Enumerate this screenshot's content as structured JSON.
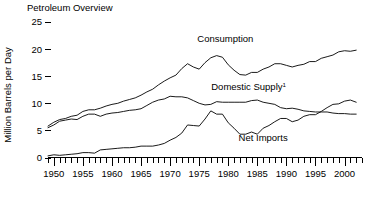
{
  "chart_data": {
    "type": "line",
    "title": "Petroleum Overview",
    "xlabel": "",
    "ylabel": "Million Barrels per Day",
    "xlim": [
      1949,
      2003
    ],
    "ylim": [
      0,
      25
    ],
    "yticks": [
      "0",
      "5",
      "10",
      "15",
      "20",
      "25"
    ],
    "ytick_values": [
      0,
      5,
      10,
      15,
      20,
      25
    ],
    "xticks": [
      "1950",
      "1955",
      "1960",
      "1965",
      "1970",
      "1975",
      "1980",
      "1985",
      "1990",
      "1995",
      "2000"
    ],
    "xtick_values": [
      1950,
      1955,
      1960,
      1965,
      1970,
      1975,
      1980,
      1985,
      1990,
      1995,
      2000
    ],
    "minor_tick_interval": 1,
    "grid": false,
    "legend": "inline-labels",
    "footnote_marker": "1",
    "x": [
      1949,
      1950,
      1951,
      1952,
      1953,
      1954,
      1955,
      1956,
      1957,
      1958,
      1959,
      1960,
      1961,
      1962,
      1963,
      1964,
      1965,
      1966,
      1967,
      1968,
      1969,
      1970,
      1971,
      1972,
      1973,
      1974,
      1975,
      1976,
      1977,
      1978,
      1979,
      1980,
      1981,
      1982,
      1983,
      1984,
      1985,
      1986,
      1987,
      1988,
      1989,
      1990,
      1991,
      1992,
      1993,
      1994,
      1995,
      1996,
      1997,
      1998,
      1999,
      2000,
      2001,
      2002
    ],
    "series": [
      {
        "name": "Consumption",
        "label": "Consumption",
        "label_x": 1979.5,
        "label_y": 21.3,
        "values": [
          5.8,
          6.5,
          7.0,
          7.2,
          7.6,
          7.8,
          8.5,
          8.8,
          8.8,
          9.1,
          9.5,
          9.8,
          10.0,
          10.4,
          10.7,
          11.0,
          11.5,
          12.1,
          12.6,
          13.4,
          14.1,
          14.7,
          15.2,
          16.4,
          17.3,
          16.7,
          16.3,
          17.5,
          18.4,
          18.8,
          18.5,
          17.1,
          16.1,
          15.3,
          15.2,
          15.7,
          15.7,
          16.3,
          16.7,
          17.3,
          17.3,
          17.0,
          16.7,
          17.0,
          17.2,
          17.7,
          17.7,
          18.3,
          18.6,
          18.9,
          19.5,
          19.7,
          19.6,
          19.8
        ]
      },
      {
        "name": "Domestic Supply",
        "label": "Domestic Supply",
        "label_x": 1983.5,
        "label_y": 12.4,
        "values": [
          5.5,
          6.0,
          6.7,
          6.9,
          7.1,
          7.0,
          7.6,
          8.0,
          8.0,
          7.6,
          8.0,
          8.2,
          8.3,
          8.5,
          8.7,
          8.8,
          9.0,
          9.6,
          10.2,
          10.6,
          10.8,
          11.3,
          11.2,
          11.2,
          11.0,
          10.5,
          10.0,
          9.7,
          9.8,
          10.3,
          10.2,
          10.2,
          10.2,
          10.2,
          10.2,
          10.5,
          10.6,
          10.2,
          10.0,
          9.8,
          9.2,
          9.0,
          9.1,
          8.9,
          8.6,
          8.5,
          8.4,
          8.4,
          8.4,
          8.2,
          8.1,
          8.1,
          8.0,
          8.0
        ]
      },
      {
        "name": "Net Imports",
        "label": "Net Imports",
        "label_x": 1986.0,
        "label_y": 3.1,
        "values": [
          0.3,
          0.5,
          0.4,
          0.5,
          0.6,
          0.7,
          0.9,
          0.9,
          0.8,
          1.4,
          1.5,
          1.6,
          1.7,
          1.8,
          1.8,
          1.9,
          2.1,
          2.1,
          2.1,
          2.3,
          2.6,
          3.2,
          3.7,
          4.5,
          6.0,
          5.9,
          5.8,
          7.1,
          8.6,
          8.0,
          8.0,
          6.4,
          5.4,
          4.3,
          4.3,
          4.7,
          4.3,
          5.4,
          5.9,
          6.6,
          7.2,
          7.2,
          6.6,
          6.9,
          7.6,
          7.9,
          7.9,
          8.5,
          9.2,
          9.8,
          9.9,
          10.4,
          10.6,
          10.2
        ]
      }
    ]
  }
}
